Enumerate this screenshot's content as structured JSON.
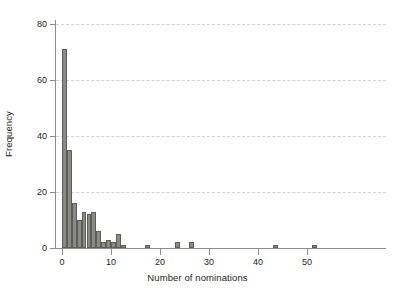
{
  "chart_data": {
    "type": "bar",
    "title": "",
    "subtitle": "",
    "xlabel": "Number of nominations",
    "ylabel": "Frequency",
    "xlim": [
      -1,
      53
    ],
    "ylim": [
      0,
      80
    ],
    "grid": true,
    "legend": null,
    "bin_width": 1,
    "xticks": [
      0,
      10,
      20,
      30,
      40,
      50
    ],
    "yticks": [
      0,
      20,
      40,
      60,
      80
    ],
    "categories": [
      0,
      1,
      2,
      3,
      4,
      5,
      6,
      7,
      8,
      9,
      10,
      11,
      12,
      17,
      23,
      26,
      43,
      51
    ],
    "values": [
      71,
      35,
      16,
      10,
      13,
      12,
      13,
      6,
      2,
      3,
      2,
      5,
      1,
      1,
      2,
      2,
      1,
      1
    ],
    "colors": {
      "bar_fill": "#8a8a87",
      "bar_border": "#5d5d5a",
      "gridline": "#d2d2d2",
      "axis": "#8d8d8d",
      "text": "#231f20",
      "background": "#ffffff"
    }
  },
  "axes": {
    "x_tick_labels": [
      "0",
      "10",
      "20",
      "30",
      "40",
      "50"
    ],
    "y_tick_labels": [
      "0",
      "20",
      "40",
      "60",
      "80"
    ],
    "x_axis_title": "Number of nominations",
    "y_axis_title": "Frequency"
  }
}
